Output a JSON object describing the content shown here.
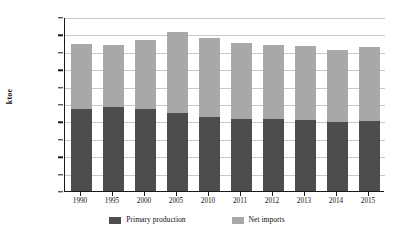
{
  "chart_data": {
    "type": "bar",
    "subtype": "stacked-vertical",
    "title": "",
    "xlabel": "",
    "ylabel": "ktoe",
    "ylim": [
      0,
      2000000
    ],
    "ytick_step": 200000,
    "ytick_labels": [
      "0",
      "200000",
      "400000",
      "600000",
      "800000",
      "1000000",
      "1200000",
      "1400000",
      "1600000",
      "1800000",
      "2000000"
    ],
    "ytick_values": [
      0,
      200000,
      400000,
      600000,
      800000,
      1000000,
      1200000,
      1400000,
      1600000,
      1800000,
      2000000
    ],
    "grid": true,
    "grid_axis": "y",
    "legend_position": "bottom",
    "categories": [
      "1990",
      "1995",
      "2000",
      "2005",
      "2010",
      "2011",
      "2012",
      "2013",
      "2014",
      "2015"
    ],
    "series": [
      {
        "name": "Primary production",
        "color": "#4d4d4d",
        "values": [
          942000,
          965000,
          942000,
          897000,
          851000,
          828000,
          828000,
          816000,
          793000,
          805000
        ]
      },
      {
        "name": "Net imports",
        "color": "#a8a8a8",
        "values": [
          748000,
          713000,
          794000,
          931000,
          908000,
          873000,
          850000,
          851000,
          828000,
          850000
        ]
      }
    ],
    "totals": [
      1690000,
      1678000,
      1736000,
      1828000,
      1759000,
      1701000,
      1678000,
      1667000,
      1621000,
      1655000
    ]
  },
  "legend": {
    "entries": [
      {
        "label": "Primary production",
        "color": "#4d4d4d"
      },
      {
        "label": "Net imports",
        "color": "#a8a8a8"
      }
    ]
  },
  "colors": {
    "background": "#ffffff",
    "axis": "#1a1a1a",
    "gridline": "#c9c9c9",
    "text": "#111111",
    "primary_production": "#4d4d4d",
    "net_imports": "#a8a8a8"
  }
}
